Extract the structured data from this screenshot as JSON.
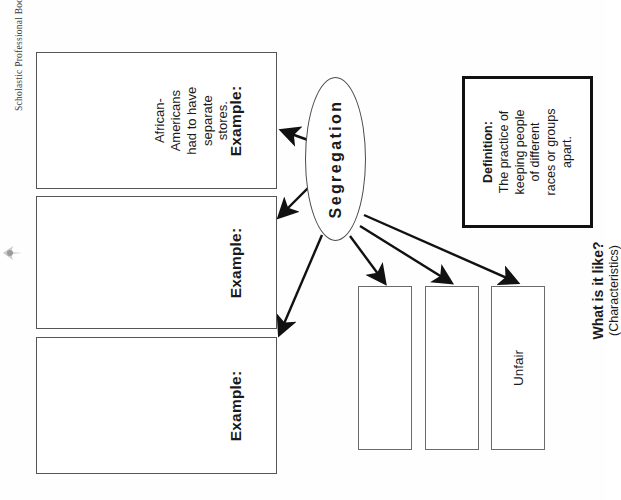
{
  "worksheet": {
    "credit": "Scholastic Professional Books",
    "orientation_note": "sideways"
  },
  "concept": {
    "label": "Segregation"
  },
  "definition": {
    "title": "Definition:",
    "line1": "The practice of",
    "line2": "keeping people",
    "line3": "of different",
    "line4": "races or groups",
    "line5": "apart."
  },
  "characteristics": {
    "heading": "What is it like?",
    "subheading": "(Characteristics)",
    "boxes": [
      {
        "text": ""
      },
      {
        "text": ""
      },
      {
        "text": "Unfair"
      }
    ]
  },
  "examples": [
    {
      "label": "Example:",
      "line1": "African-",
      "line2": "Americans",
      "line3": "had to have",
      "line4": "separate",
      "line5": "stores."
    },
    {
      "label": "Example:",
      "line1": "",
      "line2": "",
      "line3": "",
      "line4": "",
      "line5": ""
    },
    {
      "label": "Example:",
      "line1": "",
      "line2": "",
      "line3": "",
      "line4": "",
      "line5": ""
    }
  ],
  "colors": {
    "ink": "#111111",
    "box_border": "#555555",
    "paper": "#ffffff"
  }
}
